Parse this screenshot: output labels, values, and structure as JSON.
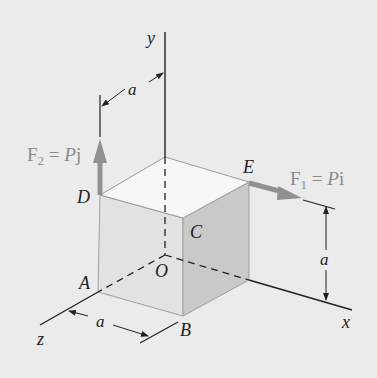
{
  "diagram": {
    "type": "3d-cube-statics",
    "background_color": "#ebebeb",
    "axes": {
      "x_label": "x",
      "y_label": "y",
      "z_label": "z"
    },
    "points": {
      "origin": "O",
      "A": "A",
      "B": "B",
      "C": "C",
      "D": "D",
      "E": "E"
    },
    "dimensions": {
      "top_offset": "a",
      "right_height": "a",
      "bottom_width": "a"
    },
    "forces": {
      "F1": {
        "label_main": "F",
        "sub": "1",
        "eq": " = ",
        "mag": "P",
        "unit": "i",
        "color": "#909090"
      },
      "F2": {
        "label_main": "F",
        "sub": "2",
        "eq": " = ",
        "mag": "P",
        "unit": "j",
        "color": "#909090"
      }
    },
    "colors": {
      "top_face": "#f7f7f7",
      "front_face": "#e2e2e2",
      "side_face": "#c9c9c9",
      "edge": "#9a9a9a",
      "axis": "#222222"
    }
  }
}
